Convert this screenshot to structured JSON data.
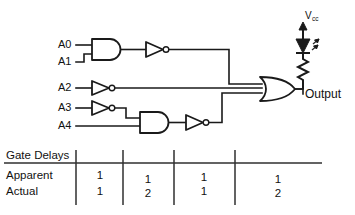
{
  "diagram": {
    "inputs": [
      {
        "label": "A0",
        "x": 58,
        "y": 45
      },
      {
        "label": "A1",
        "x": 58,
        "y": 62
      },
      {
        "label": "A2",
        "x": 58,
        "y": 88
      },
      {
        "label": "A3",
        "x": 58,
        "y": 108
      },
      {
        "label": "A4",
        "x": 58,
        "y": 126
      }
    ],
    "output": {
      "label": "Output",
      "x": 303,
      "y": 94
    },
    "supply": {
      "label": "V",
      "subscript": "cc",
      "x": 310,
      "y": 16
    },
    "gates": [
      {
        "name": "and-gate-a0a1",
        "type": "AND",
        "inputs": [
          "A0",
          "A1"
        ]
      },
      {
        "name": "not-gate-and1",
        "type": "NOT",
        "inputs": [
          "AND(A0,A1)"
        ]
      },
      {
        "name": "not-gate-a2",
        "type": "NOT",
        "inputs": [
          "A2"
        ]
      },
      {
        "name": "not-gate-a3",
        "type": "NOT",
        "inputs": [
          "A3"
        ]
      },
      {
        "name": "and-gate-a3a4",
        "type": "AND",
        "inputs": [
          "NOT(A3)",
          "A4"
        ]
      },
      {
        "name": "not-gate-and2",
        "type": "NOT",
        "inputs": [
          "AND(NOT(A3),A4)"
        ]
      },
      {
        "name": "or-gate-output",
        "type": "OR",
        "inputs": [
          "NOT(AND(A0,A1))",
          "NOT(A2)",
          "NOT(AND(NOT(A3),A4))"
        ]
      }
    ],
    "components": [
      {
        "name": "led",
        "type": "LED"
      },
      {
        "name": "resistor",
        "type": "Resistor"
      }
    ],
    "colors": {
      "ink": "#1a1a1a",
      "background": "#ffffff",
      "rule": "#2f2f2f"
    }
  },
  "table": {
    "header_label": "Gate Delays",
    "rows": [
      {
        "label": "Apparent",
        "values": [
          "1",
          "1",
          "1",
          "1"
        ]
      },
      {
        "label": "Actual",
        "values": [
          "1",
          "2",
          "1",
          "2"
        ]
      }
    ],
    "column_centers": [
      100,
      148,
      204,
      278
    ],
    "divider_x": [
      76,
      123,
      174,
      235
    ],
    "rule_y": 163,
    "rule_x_start": 4,
    "rule_x_end": 322
  }
}
